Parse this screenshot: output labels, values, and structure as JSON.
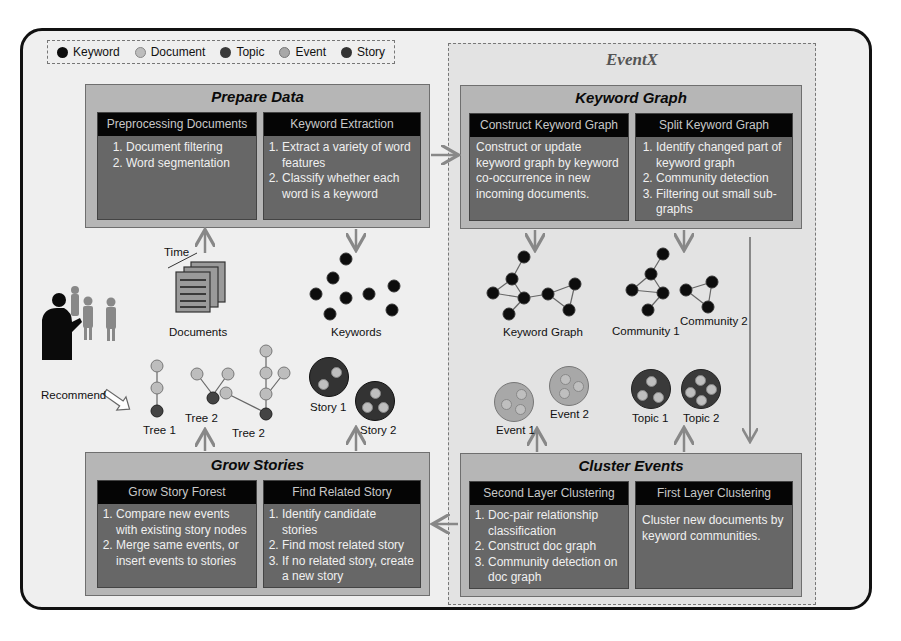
{
  "legend": {
    "items": [
      {
        "label": "Keyword",
        "icon": "keyword-node-icon",
        "color": "#0d0d0d"
      },
      {
        "label": "Document",
        "icon": "document-node-icon",
        "color": "#bdbdbd"
      },
      {
        "label": "Topic",
        "icon": "topic-node-icon",
        "color": "#3a3a3a"
      },
      {
        "label": "Event",
        "icon": "event-node-icon",
        "color": "#a8a8a8"
      },
      {
        "label": "Story",
        "icon": "story-node-icon",
        "color": "#333333"
      }
    ]
  },
  "eventx": {
    "title": "EventX"
  },
  "stages": {
    "prepare": {
      "title": "Prepare Data",
      "panels": [
        {
          "head": "Preprocessing Documents",
          "items": [
            "Document filtering",
            "Word segmentation"
          ]
        },
        {
          "head": "Keyword Extraction",
          "items": [
            "Extract a variety of word features",
            "Classify whether each word is a keyword"
          ]
        }
      ]
    },
    "keyword_graph": {
      "title": "Keyword Graph",
      "panels": [
        {
          "head": "Construct Keyword Graph",
          "text": "Construct or update keyword graph by keyword co-occurrence in new incoming documents."
        },
        {
          "head": "Split Keyword Graph",
          "items": [
            "Identify changed part of keyword graph",
            "Community detection",
            "Filtering out small sub-graphs"
          ]
        }
      ]
    },
    "grow": {
      "title": "Grow Stories",
      "panels": [
        {
          "head": "Grow Story Forest",
          "items": [
            "Compare new events with existing story nodes",
            "Merge same events, or insert events to stories"
          ]
        },
        {
          "head": "Find Related Story",
          "items": [
            "Identify candidate stories",
            "Find most related story",
            "If no related story, create a new story"
          ]
        }
      ]
    },
    "cluster": {
      "title": "Cluster Events",
      "panels": [
        {
          "head": "Second Layer Clustering",
          "items": [
            "Doc-pair relationship classification",
            "Construct doc graph",
            "Community detection on doc graph"
          ]
        },
        {
          "head": "First Layer Clustering",
          "text": "Cluster new documents by keyword communities."
        }
      ]
    }
  },
  "illustrations": {
    "time_label": "Time",
    "documents_label": "Documents",
    "keywords_label": "Keywords",
    "keyword_graph_label": "Keyword Graph",
    "community1_label": "Community 1",
    "community2_label": "Community 2",
    "event1_label": "Event 1",
    "event2_label": "Event 2",
    "topic1_label": "Topic 1",
    "topic2_label": "Topic 2",
    "story1_label": "Story 1",
    "story2_label": "Story 2",
    "tree1_label": "Tree 1",
    "tree2a_label": "Tree 2",
    "tree2b_label": "Tree 2",
    "recommend_label": "Recommend"
  }
}
